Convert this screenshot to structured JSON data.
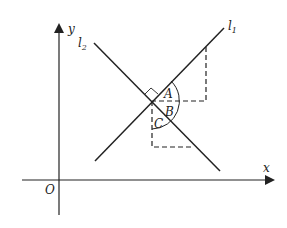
{
  "diagram": {
    "axes": {
      "x_label": "x",
      "y_label": "y",
      "origin_label": "O"
    },
    "lines": [
      {
        "name": "l",
        "subscript": "1"
      },
      {
        "name": "l",
        "subscript": "2"
      }
    ],
    "angles": [
      "A",
      "B",
      "C"
    ]
  }
}
